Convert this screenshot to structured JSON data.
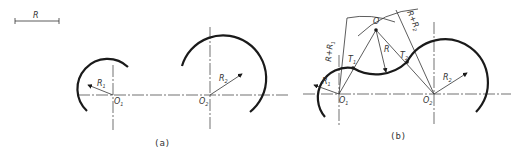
{
  "scale_bar": {
    "label": "R"
  },
  "figure_a": {
    "caption": "(a)",
    "circle1": {
      "center_label": "O",
      "center_sub": "1",
      "radius_label": "R",
      "radius_sub": "1"
    },
    "circle2": {
      "center_label": "O",
      "center_sub": "2",
      "radius_label": "R",
      "radius_sub": "2"
    }
  },
  "figure_b": {
    "caption": "(b)",
    "circle1": {
      "center_label": "O",
      "center_sub": "1",
      "radius_label": "R",
      "radius_sub": "1"
    },
    "circle2": {
      "center_label": "O",
      "center_sub": "2",
      "radius_label": "R",
      "radius_sub": "2"
    },
    "arc_center": {
      "label": "O"
    },
    "arc_radius": {
      "label": "R"
    },
    "tangent1": {
      "label": "T",
      "sub": "1"
    },
    "tangent2": {
      "label": "T",
      "sub": "2"
    },
    "dim1": {
      "label": "R+R",
      "sub": "1"
    },
    "dim2": {
      "label": "R+R",
      "sub": "2"
    }
  },
  "colors": {
    "line": "#1a1a1a",
    "background": "#ffffff"
  }
}
